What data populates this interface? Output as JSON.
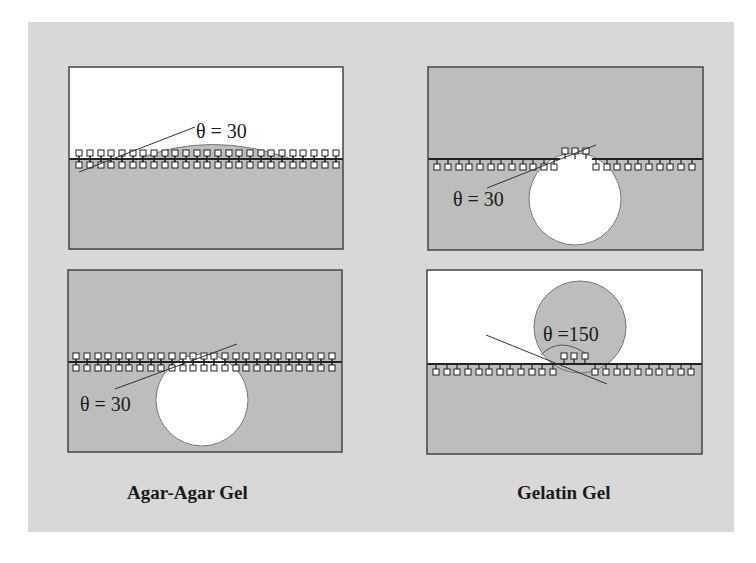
{
  "figure": {
    "background": "#d8d8d8",
    "gel_fill": "#bdbdbd",
    "panels": [
      {
        "id": "agar-top",
        "column": "Agar-Agar Gel",
        "row": 1,
        "angle_label": "θ = 30",
        "description": "Droplet spreading on gel surface, gel below, air above"
      },
      {
        "id": "gelatin-top",
        "column": "Gelatin Gel",
        "row": 1,
        "angle_label": "θ = 30",
        "description": "Bubble in lower phase, gel above"
      },
      {
        "id": "agar-bottom",
        "column": "Agar-Agar Gel",
        "row": 2,
        "angle_label": "θ = 30",
        "description": "Bubble below interface, gel above and below"
      },
      {
        "id": "gelatin-bottom",
        "column": "Gelatin Gel",
        "row": 2,
        "angle_label": "θ =150",
        "description": "Gel droplet sitting on gel surface in air"
      }
    ],
    "labels": {
      "left": "Agar-Agar Gel",
      "right": "Gelatin Gel"
    }
  }
}
